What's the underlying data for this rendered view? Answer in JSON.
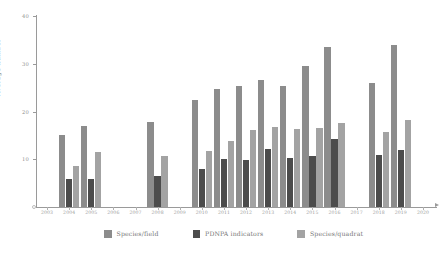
{
  "chart_data": {
    "type": "bar",
    "title": "",
    "xlabel": "",
    "ylabel": "Average number",
    "ylim": [
      0,
      40
    ],
    "yticks": [
      0,
      10,
      20,
      30,
      40
    ],
    "ytick_labels": [
      "0",
      "10",
      "20",
      "30",
      "40"
    ],
    "grid": false,
    "legend_position": "bottom",
    "categories": [
      "2003",
      "2004",
      "2005",
      "2006",
      "2007",
      "2008",
      "2009",
      "2010",
      "2011",
      "2012",
      "2013",
      "2014",
      "2015",
      "2016",
      "2017",
      "2018",
      "2019",
      "2020"
    ],
    "series": [
      {
        "name": "Species/field",
        "color": "#8c8c8c",
        "values": [
          null,
          15.0,
          17.0,
          null,
          null,
          17.8,
          null,
          22.5,
          24.8,
          25.3,
          26.5,
          25.3,
          29.5,
          33.5,
          null,
          26.0,
          34.0,
          null
        ]
      },
      {
        "name": "PDNPA indicators",
        "color": "#4c4c4c",
        "values": [
          null,
          5.8,
          5.8,
          null,
          null,
          6.5,
          null,
          8.0,
          10.0,
          9.8,
          12.2,
          10.3,
          10.6,
          14.3,
          null,
          10.8,
          12.0,
          null
        ]
      },
      {
        "name": "Species/quadrat",
        "color": "#a3a3a3",
        "values": [
          null,
          8.5,
          11.5,
          null,
          null,
          10.6,
          null,
          11.8,
          13.8,
          16.2,
          16.8,
          16.3,
          16.5,
          17.5,
          null,
          15.8,
          18.2,
          null
        ]
      }
    ]
  },
  "axis": {
    "y_label": "Average number",
    "y_tick_labels": [
      "40",
      "30",
      "20",
      "10"
    ],
    "x_tick_labels": [
      "2003",
      "2004",
      "2005",
      "2006",
      "2007",
      "2008",
      "2009",
      "2010",
      "2011",
      "2012",
      "2013",
      "2014",
      "2015",
      "2016",
      "2017",
      "2018",
      "2019",
      "2020"
    ]
  },
  "legend": {
    "items": [
      {
        "label": "Species/field",
        "color": "#8c8c8c"
      },
      {
        "label": "PDNPA indicators",
        "color": "#4c4c4c"
      },
      {
        "label": "Species/quadrat",
        "color": "#a3a3a3"
      }
    ]
  }
}
